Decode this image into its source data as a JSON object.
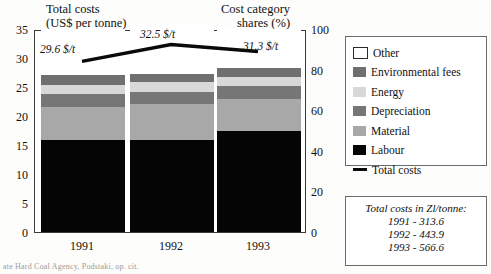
{
  "figure": {
    "title_left_line1": "Total costs",
    "title_left_line2": "(US$ per tonne)",
    "title_right_line1": "Cost category",
    "title_right_line2": "shares (%)",
    "source_note": "ate Hard Coal Agency, Podstaki, op. cit."
  },
  "legend": {
    "items": [
      {
        "label": "Other",
        "color": "#ffffff",
        "swatch": "outline"
      },
      {
        "label": "Environmental fees",
        "color": "#6f6f6f",
        "swatch": "fill"
      },
      {
        "label": "Energy",
        "color": "#d8d8d8",
        "swatch": "fill"
      },
      {
        "label": "Depreciation",
        "color": "#767676",
        "swatch": "fill"
      },
      {
        "label": "Material",
        "color": "#a8a8a8",
        "swatch": "fill"
      },
      {
        "label": "Labour",
        "color": "#050505",
        "swatch": "fill"
      },
      {
        "label": "Total costs",
        "color": "#0a0a0a",
        "swatch": "line"
      }
    ]
  },
  "note_box": {
    "heading": "Total costs in Zl/tonne:",
    "rows": [
      "1991 - 313.6",
      "1992 - 443.9",
      "1993 - 566.6"
    ]
  },
  "chart_data": {
    "type": "bar",
    "xlabel": "",
    "ylabel": "Total costs (US$ per tonne)",
    "ylabel_right": "Cost category shares (%)",
    "categories": [
      "1991",
      "1992",
      "1993"
    ],
    "ylim": [
      0,
      35
    ],
    "yticks": [
      0,
      5,
      10,
      15,
      20,
      25,
      30,
      35
    ],
    "ylim_right": [
      0,
      100
    ],
    "yticks_right": [
      0,
      20,
      40,
      60,
      80,
      100
    ],
    "grid": false,
    "legend_position": "right",
    "stacked": true,
    "series": [
      {
        "name": "Labour",
        "color": "#050505",
        "values": [
          15.9,
          15.9,
          17.4
        ]
      },
      {
        "name": "Material",
        "color": "#a8a8a8",
        "values": [
          5.7,
          6.1,
          5.5
        ]
      },
      {
        "name": "Depreciation",
        "color": "#767676",
        "values": [
          2.2,
          2.1,
          2.3
        ]
      },
      {
        "name": "Energy",
        "color": "#d8d8d8",
        "values": [
          1.6,
          1.7,
          1.6
        ]
      },
      {
        "name": "Environmental fees",
        "color": "#6f6f6f",
        "values": [
          1.6,
          1.5,
          1.5
        ]
      },
      {
        "name": "Other",
        "color": "#ffffff",
        "values": [
          8.0,
          8.7,
          6.7
        ]
      }
    ],
    "overlay_line": {
      "name": "Total costs",
      "color": "#0a0a0a",
      "values": [
        29.6,
        32.5,
        31.3
      ],
      "point_labels": [
        "29.6 $/t",
        "32.5 $/t",
        "31.3 $/t"
      ]
    }
  }
}
